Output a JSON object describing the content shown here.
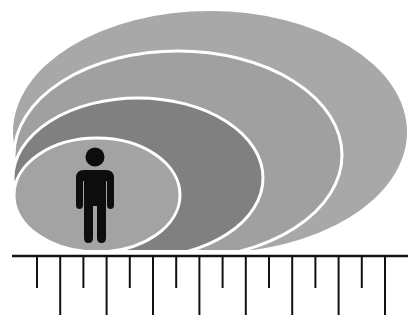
{
  "diagram": {
    "layers": [
      {
        "id": "layer-4",
        "label": "outermost layer",
        "fill": "#a8a8a8"
      },
      {
        "id": "layer-3",
        "label": "third layer",
        "fill": "#a0a0a0"
      },
      {
        "id": "layer-2",
        "label": "second layer",
        "fill": "#808080"
      },
      {
        "id": "layer-1",
        "label": "innermost layer",
        "fill": "#a3a3a3"
      }
    ],
    "outline_color": "#ffffff",
    "figure": {
      "icon": "person-icon",
      "color": "#0d0d0d"
    },
    "timeline": {
      "axis_color": "#111111",
      "tick_count": 16,
      "tick_pattern": [
        "short",
        "long"
      ]
    }
  }
}
